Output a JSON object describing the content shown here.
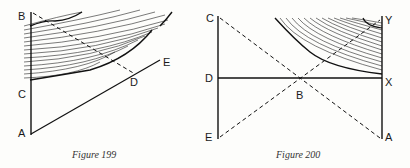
{
  "figures": [
    {
      "caption": "Figure 199",
      "labels": {
        "B": "B",
        "C": "C",
        "A": "A",
        "D": "D",
        "E": "E"
      }
    },
    {
      "caption": "Figure 200",
      "labels": {
        "C": "C",
        "D": "D",
        "E": "E",
        "B": "B",
        "Y": "Y",
        "X": "X",
        "A": "A"
      }
    }
  ],
  "colors": {
    "ink": "#1a1a1a",
    "paper": "#fdfdfb"
  }
}
